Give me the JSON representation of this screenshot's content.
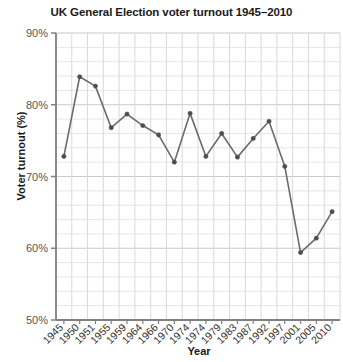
{
  "chart_data": {
    "type": "line",
    "title": "UK General Election voter turnout 1945–2010",
    "xlabel": "Year",
    "ylabel": "Voter turnout (%)",
    "categories": [
      "1945",
      "1950",
      "1951",
      "1955",
      "1959",
      "1964",
      "1966",
      "1970",
      "1974",
      "1974",
      "1979",
      "1983",
      "1987",
      "1992",
      "1997",
      "2001",
      "2005",
      "2010"
    ],
    "values": [
      72.8,
      83.9,
      82.6,
      76.8,
      78.7,
      77.1,
      75.8,
      72.0,
      78.8,
      72.8,
      76.0,
      72.7,
      75.3,
      77.7,
      71.4,
      59.4,
      61.4,
      65.1
    ],
    "series": [
      {
        "name": "Voter turnout (%)",
        "values": [
          72.8,
          83.9,
          82.6,
          76.8,
          78.7,
          77.1,
          75.8,
          72.0,
          78.8,
          72.8,
          76.0,
          72.7,
          75.3,
          77.7,
          71.4,
          59.4,
          61.4,
          65.1
        ]
      }
    ],
    "ylim": [
      50,
      90
    ],
    "ytick_labels": [
      "50%",
      "60%",
      "70%",
      "80%",
      "90%"
    ],
    "ytick_values": [
      50,
      60,
      70,
      80,
      90
    ],
    "y_minor_step": 2,
    "grid": true,
    "legend": false,
    "legend_position": "none",
    "line_color": "#6b6b6b",
    "marker_color": "#4d4d4d",
    "grid_color": "#d9d9dd",
    "axis_color": "#808080",
    "background_color": "#ffffff"
  }
}
